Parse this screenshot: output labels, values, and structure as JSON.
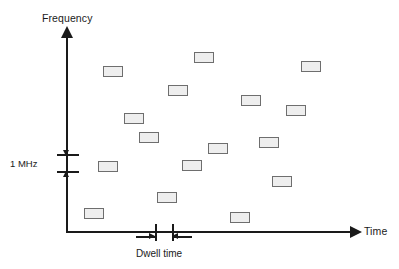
{
  "chart_data": {
    "type": "scatter",
    "title": "",
    "xlabel": "Time",
    "ylabel": "Frequency",
    "grid": false,
    "legend": null,
    "marker": {
      "shape": "rectangle",
      "width_px": 20,
      "height_px": 11,
      "fill": "#eeeeee",
      "stroke": "#6e6e6e"
    },
    "annotations": [
      {
        "name": "frequency-step",
        "label": "1 MHz",
        "axis": "y",
        "meaning": "vertical extent of one hop channel"
      },
      {
        "name": "dwell-time",
        "label": "Dwell time",
        "axis": "x",
        "meaning": "horizontal extent of one hop in time"
      }
    ],
    "hops": [
      {
        "id": 1,
        "x_px": 84,
        "y_px": 208
      },
      {
        "id": 2,
        "x_px": 98,
        "y_px": 161
      },
      {
        "id": 3,
        "x_px": 103,
        "y_px": 66
      },
      {
        "id": 4,
        "x_px": 124,
        "y_px": 113
      },
      {
        "id": 5,
        "x_px": 139,
        "y_px": 132
      },
      {
        "id": 6,
        "x_px": 157,
        "y_px": 192
      },
      {
        "id": 7,
        "x_px": 168,
        "y_px": 85
      },
      {
        "id": 8,
        "x_px": 182,
        "y_px": 160
      },
      {
        "id": 9,
        "x_px": 194,
        "y_px": 52
      },
      {
        "id": 10,
        "x_px": 208,
        "y_px": 143
      },
      {
        "id": 11,
        "x_px": 230,
        "y_px": 212
      },
      {
        "id": 12,
        "x_px": 241,
        "y_px": 95
      },
      {
        "id": 13,
        "x_px": 259,
        "y_px": 137
      },
      {
        "id": 14,
        "x_px": 272,
        "y_px": 176
      },
      {
        "id": 15,
        "x_px": 286,
        "y_px": 105
      },
      {
        "id": 16,
        "x_px": 301,
        "y_px": 61
      }
    ]
  },
  "axes": {
    "y_label": "Frequency",
    "x_label": "Time"
  },
  "annotations": {
    "frequency_step_label": "1 MHz",
    "dwell_time_label": "Dwell time"
  }
}
